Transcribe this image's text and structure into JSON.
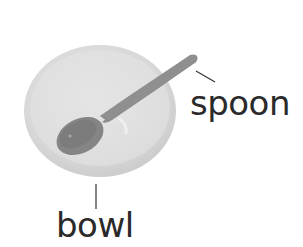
{
  "diagram": {
    "labels": {
      "spoon": "spoon",
      "bowl": "bowl"
    },
    "colors": {
      "bowl_fill": "#d9d9d9",
      "bowl_inner": "#e2e2e2",
      "spoon_fill": "#8e8e8e",
      "leader_line": "#333333",
      "text": "#2a2a2a"
    }
  }
}
